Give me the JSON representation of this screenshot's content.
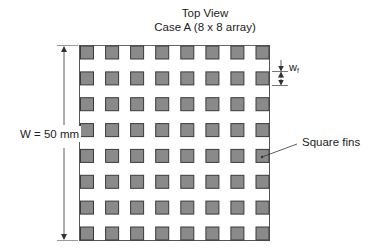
{
  "title": {
    "line1": "Top View",
    "line2": "Case A (8 x 8 array)"
  },
  "dimensions": {
    "width_label": "W = 50 mm",
    "fin_width_label": "w",
    "fin_width_subscript": "f"
  },
  "annotations": {
    "fins_label": "Square fins"
  },
  "array": {
    "rows": 8,
    "columns": 8,
    "fin_shape": "square"
  },
  "colors": {
    "fin_fill": "#8a8a8a",
    "fin_stroke": "#3a3a3a",
    "board_stroke": "#555555",
    "line": "#333333",
    "background": "#ffffff"
  }
}
